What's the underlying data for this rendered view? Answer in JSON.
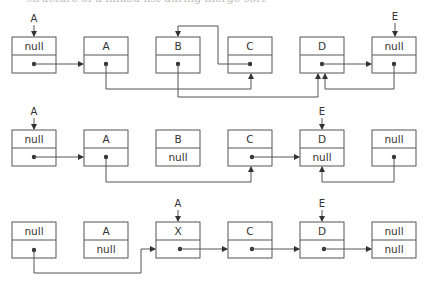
{
  "caption": "structure of a linked list during merge sort",
  "colors": {
    "stroke": "#555555",
    "text": "#333333",
    "background": "#ffffff"
  },
  "rows": [
    {
      "id": "row-1",
      "pointers": [
        {
          "label": "A",
          "target_node": 0
        },
        {
          "label": "E",
          "target_node": 5
        }
      ],
      "nodes": [
        {
          "value": "null",
          "next": "dot"
        },
        {
          "value": "A",
          "next": "dot"
        },
        {
          "value": "B",
          "next": "dot"
        },
        {
          "value": "C",
          "next": "dot"
        },
        {
          "value": "D",
          "next": "dot"
        },
        {
          "value": "null",
          "next": "dot"
        }
      ],
      "links": [
        {
          "from": 0,
          "to": 1
        },
        {
          "from": 1,
          "to": 3
        },
        {
          "from": 2,
          "to": 4
        },
        {
          "from": 3,
          "to": 2
        },
        {
          "from": 4,
          "to": 5
        },
        {
          "from": 5,
          "to": 4
        }
      ]
    },
    {
      "id": "row-2",
      "pointers": [
        {
          "label": "A",
          "target_node": 0
        },
        {
          "label": "E",
          "target_node": 4
        }
      ],
      "nodes": [
        {
          "value": "null",
          "next": "dot"
        },
        {
          "value": "A",
          "next": "dot"
        },
        {
          "value": "B",
          "next": "null"
        },
        {
          "value": "C",
          "next": "dot"
        },
        {
          "value": "D",
          "next": "null"
        },
        {
          "value": "null",
          "next": "dot"
        }
      ],
      "links": [
        {
          "from": 0,
          "to": 1
        },
        {
          "from": 1,
          "to": 3
        },
        {
          "from": 3,
          "to": 4
        },
        {
          "from": 5,
          "to": 4
        }
      ]
    },
    {
      "id": "row-3",
      "pointers": [
        {
          "label": "A",
          "target_node": 2
        },
        {
          "label": "E",
          "target_node": 4
        }
      ],
      "nodes": [
        {
          "value": "null",
          "next": "dot"
        },
        {
          "value": "A",
          "next": "null"
        },
        {
          "value": "X",
          "next": "dot"
        },
        {
          "value": "C",
          "next": "dot"
        },
        {
          "value": "D",
          "next": "dot"
        },
        {
          "value": "null",
          "next": "null"
        }
      ],
      "links": [
        {
          "from": 0,
          "to": 2
        },
        {
          "from": 2,
          "to": 3
        },
        {
          "from": 3,
          "to": 4
        },
        {
          "from": 4,
          "to": 5
        }
      ]
    }
  ]
}
